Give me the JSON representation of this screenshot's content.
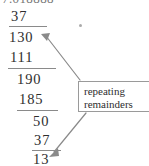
{
  "figure": {
    "kind": "long-division-worked-example",
    "background_color": "#ffffff",
    "ink_color": "#2e2e2e",
    "rule_color": "#8a8a8a"
  },
  "clipped_dividend": {
    "text": "7.018888"
  },
  "division_rows": [
    {
      "id": "row-quotient-partial",
      "value": "37"
    },
    {
      "id": "row-bring-down-130",
      "value": "130"
    },
    {
      "id": "row-subtract-111",
      "value": "111"
    },
    {
      "id": "row-bring-down-190",
      "value": "190"
    },
    {
      "id": "row-subtract-185",
      "value": "185"
    },
    {
      "id": "row-bring-down-50",
      "value": "50"
    },
    {
      "id": "row-subtract-37",
      "value": "37"
    },
    {
      "id": "row-remainder-13",
      "value": "13"
    }
  ],
  "callout": {
    "line1": "repeating",
    "line2": "remainders",
    "border_color": "#9a9a9a"
  },
  "annotations": {
    "arrow_color": "#8a8a8a",
    "arrow_upper_target": "130",
    "arrow_lower_target": "13",
    "speck_label": "scan-speck"
  }
}
